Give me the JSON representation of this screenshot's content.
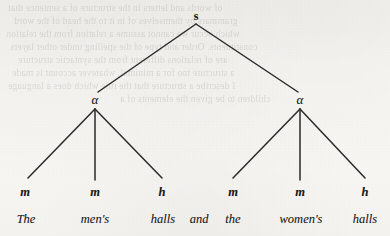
{
  "figure": {
    "kind": "syntactic-tree-diagram",
    "ink_color": "#1b1b1b",
    "paper_color": "#f7f6f3",
    "line_color": "#2a2a2a"
  },
  "tree": {
    "root": {
      "label": "s",
      "x": 196,
      "y": 16
    },
    "categories": [
      {
        "label": "α",
        "x": 95,
        "y": 100
      },
      {
        "label": "α",
        "x": 300,
        "y": 100
      }
    ],
    "leaf_labels": [
      {
        "label": "m",
        "x": 25,
        "y": 192
      },
      {
        "label": "m",
        "x": 95,
        "y": 192
      },
      {
        "label": "h",
        "x": 162,
        "y": 192
      },
      {
        "label": "m",
        "x": 233,
        "y": 192
      },
      {
        "label": "m",
        "x": 300,
        "y": 192
      },
      {
        "label": "h",
        "x": 365,
        "y": 192
      }
    ],
    "words": [
      {
        "text": "The",
        "x": 26,
        "y": 219
      },
      {
        "text": "men's",
        "x": 95,
        "y": 219
      },
      {
        "text": "halls",
        "x": 163,
        "y": 219
      },
      {
        "text": "and",
        "x": 199,
        "y": 219
      },
      {
        "text": "the",
        "x": 233,
        "y": 219
      },
      {
        "text": "women's",
        "x": 301,
        "y": 219
      },
      {
        "text": "halls",
        "x": 365,
        "y": 219
      }
    ],
    "branches": [
      {
        "from": "root",
        "x1": 196,
        "y1": 24,
        "x2": 98,
        "y2": 92
      },
      {
        "from": "root",
        "x1": 196,
        "y1": 24,
        "x2": 298,
        "y2": 92
      },
      {
        "from": "alpha-left",
        "x1": 95,
        "y1": 109,
        "x2": 28,
        "y2": 178
      },
      {
        "from": "alpha-left",
        "x1": 95,
        "y1": 109,
        "x2": 95,
        "y2": 180
      },
      {
        "from": "alpha-left",
        "x1": 95,
        "y1": 109,
        "x2": 162,
        "y2": 178
      },
      {
        "from": "alpha-right",
        "x1": 300,
        "y1": 109,
        "x2": 233,
        "y2": 178
      },
      {
        "from": "alpha-right",
        "x1": 300,
        "y1": 109,
        "x2": 300,
        "y2": 180
      },
      {
        "from": "alpha-right",
        "x1": 300,
        "y1": 109,
        "x2": 365,
        "y2": 178
      }
    ]
  },
  "background_ghost_lines": [
    {
      "text": "of words and letters in the structure of a sentence that",
      "x": 8,
      "y": 2
    },
    {
      "text": "grammars by themselves of in it to the head of the word",
      "x": 14,
      "y": 15
    },
    {
      "text": "which occur we cannot assume a relation from the relation",
      "x": 6,
      "y": 28
    },
    {
      "text": "constituents. Order and type of the spelling under other layers",
      "x": 10,
      "y": 41
    },
    {
      "text": "are of relations different from the syntactic structure",
      "x": 18,
      "y": 54
    },
    {
      "text": "a structure too for a minimal, whatever account is made",
      "x": 12,
      "y": 67
    },
    {
      "text": "I describe a structure that the rule which does a language",
      "x": 8,
      "y": 80
    },
    {
      "text": "children to be given the elements of a",
      "x": 120,
      "y": 93
    }
  ]
}
